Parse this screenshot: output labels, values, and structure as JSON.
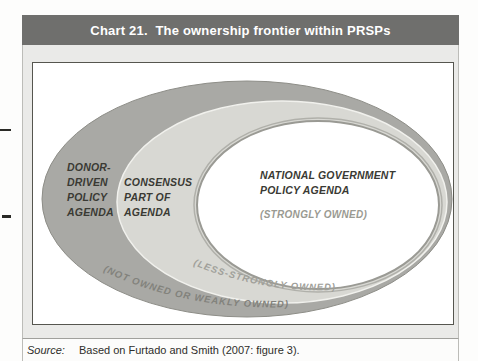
{
  "header": {
    "title": "Chart 21.  The ownership frontier within PRSPs"
  },
  "diagram": {
    "donor": {
      "lines": [
        "DONOR-",
        "DRIVEN",
        "POLICY",
        "AGENDA"
      ]
    },
    "consensus": {
      "lines": [
        "CONSENSUS",
        "PART OF",
        "AGENDA"
      ]
    },
    "national": {
      "lines": [
        "NATIONAL GOVERNMENT",
        "POLICY AGENDA"
      ],
      "ownership": "(STRONGLY OWNED)"
    },
    "middle_ring_label": "(LESS-STRONGLY OWNED)",
    "outer_ring_label": "(NOT OWNED OR WEAKLY OWNED)"
  },
  "source": {
    "prefix": "Source:",
    "text": "Based on Furtado and Smith (2007: figure 3)."
  },
  "colors": {
    "header_bg": "#6f6f6d",
    "outer_ring": "#a9a9a5",
    "middle_ring": "#d8d8d3",
    "inner_area": "#ffffff"
  }
}
